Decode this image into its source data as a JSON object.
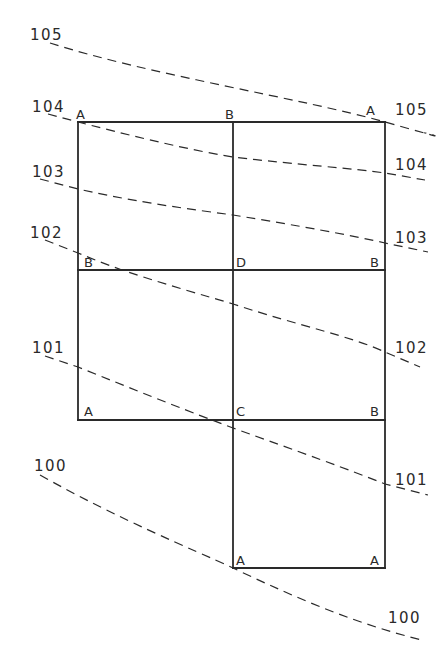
{
  "diagram": {
    "type": "grid-contour-plan",
    "corner_labels": [
      {
        "id": "r0c0",
        "text": "A"
      },
      {
        "id": "r0c1",
        "text": "B"
      },
      {
        "id": "r0c2",
        "text": "A"
      },
      {
        "id": "r1c0",
        "text": "B"
      },
      {
        "id": "r1c1",
        "text": "D"
      },
      {
        "id": "r1c2",
        "text": "B"
      },
      {
        "id": "r2c0",
        "text": "A"
      },
      {
        "id": "r2c1",
        "text": "C"
      },
      {
        "id": "r2c2",
        "text": "B"
      },
      {
        "id": "r3c1",
        "text": "A"
      },
      {
        "id": "r3c2",
        "text": "A"
      }
    ],
    "contours": [
      {
        "elevation": "105",
        "label_left": "105",
        "label_right": "105"
      },
      {
        "elevation": "104",
        "label_left": "104",
        "label_right": "104"
      },
      {
        "elevation": "103",
        "label_left": "103",
        "label_right": "103"
      },
      {
        "elevation": "102",
        "label_left": "102",
        "label_right": "102"
      },
      {
        "elevation": "101",
        "label_left": "101",
        "label_right": "101"
      },
      {
        "elevation": "100",
        "label_left": "100",
        "label_right": "100"
      }
    ]
  }
}
